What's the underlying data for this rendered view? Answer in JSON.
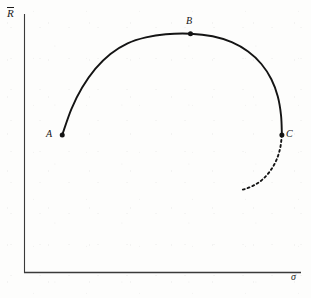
{
  "figure": {
    "background_color": "#fdfdfc",
    "ink_color": "#141414",
    "axis_color": "#3a3a3a"
  },
  "chart_data": {
    "type": "line",
    "title": "",
    "subtitle": "",
    "xlabel": "σ",
    "ylabel": "R̄",
    "xlabel_plain": "sigma",
    "ylabel_plain": "R-bar",
    "grid": false,
    "legend": false,
    "axis_style": "L-shaped spine, no ticks, no tick labels",
    "xlim": [
      0,
      1
    ],
    "ylim": [
      0,
      1
    ],
    "annotations": [
      {
        "label": "A",
        "x": 0.138,
        "y": 0.533,
        "position": "left",
        "marker": "filled-dot"
      },
      {
        "label": "B",
        "x": 0.601,
        "y": 0.924,
        "position": "above",
        "marker": "filled-dot"
      },
      {
        "label": "C",
        "x": 0.931,
        "y": 0.533,
        "position": "right",
        "marker": "filled-dot"
      }
    ],
    "series": [
      {
        "name": "solid-arc",
        "style": "solid",
        "color": "#141414",
        "width": 1.9,
        "points": [
          [
            0.138,
            0.533
          ],
          [
            0.171,
            0.633
          ],
          [
            0.21,
            0.716
          ],
          [
            0.258,
            0.789
          ],
          [
            0.312,
            0.846
          ],
          [
            0.374,
            0.887
          ],
          [
            0.44,
            0.91
          ],
          [
            0.512,
            0.922
          ],
          [
            0.601,
            0.924
          ],
          [
            0.681,
            0.914
          ],
          [
            0.75,
            0.891
          ],
          [
            0.809,
            0.855
          ],
          [
            0.857,
            0.807
          ],
          [
            0.893,
            0.748
          ],
          [
            0.916,
            0.682
          ],
          [
            0.928,
            0.608
          ],
          [
            0.931,
            0.533
          ]
        ]
      },
      {
        "name": "dashed-extension",
        "style": "dashed",
        "color": "#141414",
        "width": 1.9,
        "dash_pattern": "2,3",
        "points": [
          [
            0.931,
            0.533
          ],
          [
            0.925,
            0.483
          ],
          [
            0.912,
            0.438
          ],
          [
            0.892,
            0.399
          ],
          [
            0.866,
            0.366
          ],
          [
            0.836,
            0.342
          ],
          [
            0.803,
            0.326
          ],
          [
            0.785,
            0.321
          ]
        ]
      }
    ]
  },
  "labels": {
    "point_a": "A",
    "point_b": "B",
    "point_c": "C",
    "y_axis": "R",
    "x_axis": "σ"
  }
}
